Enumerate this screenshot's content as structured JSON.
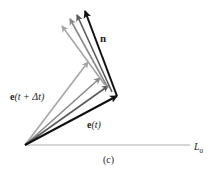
{
  "figure": {
    "panel_label": "(c)",
    "labels": {
      "n": "n",
      "e_t_plus_dt_vec": "e",
      "e_t_plus_dt_arg": "(t + Δt)",
      "e_t_vec": "e",
      "e_t_arg": "(t)",
      "L0_main": "L",
      "L0_sub": "0"
    },
    "origin": [
      25,
      145
    ],
    "baseline_end": [
      190,
      145
    ],
    "e_vectors": [
      {
        "name": "e(t+Δt) lightest",
        "end": [
          88,
          62
        ],
        "color": "#a6a6a6"
      },
      {
        "name": "e intermediate 2",
        "end": [
          100,
          78
        ],
        "color": "#8a8a8a"
      },
      {
        "name": "e intermediate 1",
        "end": [
          108,
          86
        ],
        "color": "#5a5a5a"
      },
      {
        "name": "e(t)",
        "end": [
          117,
          96
        ],
        "color": "#111111"
      }
    ],
    "n_vectors": [
      {
        "name": "n lightest",
        "start": [
          105,
          85
        ],
        "end": [
          62,
          26
        ],
        "color": "#a6a6a6"
      },
      {
        "name": "n intermediate 2",
        "start": [
          108,
          88
        ],
        "end": [
          70,
          19
        ],
        "color": "#8a8a8a"
      },
      {
        "name": "n intermediate 1",
        "start": [
          112,
          92
        ],
        "end": [
          77,
          15
        ],
        "color": "#5a5a5a"
      },
      {
        "name": "n",
        "start": [
          117,
          96
        ],
        "end": [
          85,
          11
        ],
        "color": "#111111"
      }
    ]
  }
}
